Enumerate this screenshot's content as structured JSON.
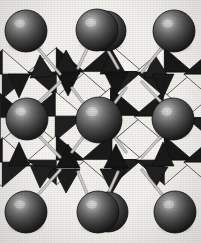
{
  "figure": {
    "caption": "",
    "type": "crystal-structure-polyhedral",
    "description": "Perovskite-type crystal structure drawn in polyhedral representation: corner-sharing BX6 octahedra shown as shaded black-and-white faceted polyhedra, with large dark grey A-site cation spheres at the cell corners, edge midpoints and body centre, joined by thin light grey bond sticks.",
    "width_px": 201,
    "height_px": 243
  },
  "colors": {
    "background": "#f2f1ee",
    "paper_light": "#faf9f6",
    "polyhedron_dark_face": "#1b1b1b",
    "polyhedron_mid_face": "#4a4a4a",
    "polyhedron_light_face": "#f6f5f1",
    "polyhedron_edge": "#0d0d0d",
    "sphere_base": "#4e4e4e",
    "sphere_dark": "#1f1f1f",
    "sphere_highlight": "#c9c9c9",
    "sphere_rim": "#101010",
    "bond_stick": "#cfcdc8",
    "bond_stick_edge": "#8e8c87"
  },
  "legend": {
    "a_site_label": "A cation",
    "octahedron_label": "BX6 octahedron",
    "bond_label": "A–X bond"
  },
  "atoms": {
    "a_site_spheres": [
      {
        "id": "A1",
        "name": "corner-top-left",
        "cx": 26,
        "cy": 31,
        "r": 21
      },
      {
        "id": "A2",
        "name": "edge-top-middle-back",
        "cx": 106,
        "cy": 31,
        "r": 20
      },
      {
        "id": "A3",
        "name": "edge-top-middle-front",
        "cx": 97,
        "cy": 30,
        "r": 21
      },
      {
        "id": "A4",
        "name": "corner-top-right",
        "cx": 174,
        "cy": 31,
        "r": 21
      },
      {
        "id": "A5",
        "name": "edge-middle-left",
        "cx": 27,
        "cy": 119,
        "r": 21
      },
      {
        "id": "A6",
        "name": "body-centre",
        "cx": 99,
        "cy": 120,
        "r": 23
      },
      {
        "id": "A7",
        "name": "edge-middle-right",
        "cx": 173,
        "cy": 119,
        "r": 21
      },
      {
        "id": "A8",
        "name": "corner-bottom-left",
        "cx": 26,
        "cy": 212,
        "r": 21
      },
      {
        "id": "A9",
        "name": "edge-bottom-middle-back",
        "cx": 108,
        "cy": 212,
        "r": 20
      },
      {
        "id": "A10",
        "name": "edge-bottom-middle-front",
        "cx": 98,
        "cy": 212,
        "r": 21
      },
      {
        "id": "A11",
        "name": "corner-bottom-right",
        "cx": 175,
        "cy": 212,
        "r": 21
      }
    ],
    "a_site_count": 11,
    "octahedra_rows": 3,
    "octahedra_cols": 3
  },
  "bonds": [
    {
      "x1": 36,
      "y1": 46,
      "x2": 60,
      "y2": 74
    },
    {
      "x1": 88,
      "y1": 47,
      "x2": 78,
      "y2": 68
    },
    {
      "x1": 106,
      "y1": 47,
      "x2": 118,
      "y2": 68
    },
    {
      "x1": 163,
      "y1": 46,
      "x2": 142,
      "y2": 72
    },
    {
      "x1": 37,
      "y1": 104,
      "x2": 60,
      "y2": 82
    },
    {
      "x1": 37,
      "y1": 134,
      "x2": 60,
      "y2": 157
    },
    {
      "x1": 163,
      "y1": 104,
      "x2": 142,
      "y2": 82
    },
    {
      "x1": 163,
      "y1": 134,
      "x2": 142,
      "y2": 157
    },
    {
      "x1": 84,
      "y1": 104,
      "x2": 72,
      "y2": 88
    },
    {
      "x1": 114,
      "y1": 104,
      "x2": 126,
      "y2": 88
    },
    {
      "x1": 84,
      "y1": 136,
      "x2": 72,
      "y2": 152
    },
    {
      "x1": 114,
      "y1": 136,
      "x2": 126,
      "y2": 152
    },
    {
      "x1": 36,
      "y1": 197,
      "x2": 60,
      "y2": 170
    },
    {
      "x1": 88,
      "y1": 196,
      "x2": 78,
      "y2": 172
    },
    {
      "x1": 107,
      "y1": 196,
      "x2": 118,
      "y2": 172
    },
    {
      "x1": 164,
      "y1": 197,
      "x2": 142,
      "y2": 170
    }
  ]
}
